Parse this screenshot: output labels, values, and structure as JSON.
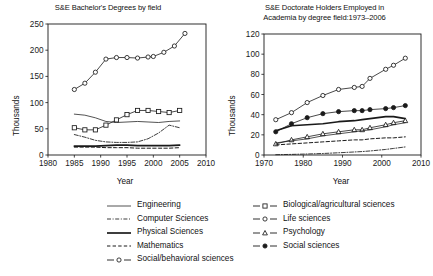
{
  "figure": {
    "ylabel": "Thousands",
    "xlabel": "Year"
  },
  "chart_data": [
    {
      "type": "line",
      "id": "bachelors",
      "title": "S&E Bachelor's Degrees by field",
      "title_line1": "S&E Bachelor's Degrees by field",
      "title_line2": "",
      "xlabel": "Year",
      "ylabel": "Thousands",
      "xlim": [
        1980,
        2010
      ],
      "ylim": [
        0,
        250
      ],
      "xticks": [
        1980,
        1985,
        1990,
        1995,
        2000,
        2005,
        2010
      ],
      "yticks": [
        0,
        50,
        100,
        150,
        200,
        250
      ],
      "grid": false,
      "legend_position": "below-figure",
      "series": [
        {
          "name": "Social/behavioral sciences",
          "marker": "open-circle",
          "linestyle": "solid",
          "x": [
            1985,
            1987,
            1989,
            1991,
            1993,
            1995,
            1997,
            1999,
            2000,
            2002,
            2004,
            2006
          ],
          "values": [
            125,
            137,
            158,
            183,
            186,
            186,
            185,
            187,
            188,
            196,
            208,
            232
          ]
        },
        {
          "name": "Biological/agricultural sciences",
          "marker": "open-square",
          "linestyle": "solid",
          "x": [
            1985,
            1987,
            1989,
            1991,
            1993,
            1995,
            1997,
            1999,
            2001,
            2003,
            2005
          ],
          "values": [
            52,
            48,
            48,
            57,
            67,
            77,
            85,
            85,
            83,
            81,
            85
          ]
        },
        {
          "name": "Engineering",
          "marker": "none",
          "linestyle": "solid-thin",
          "x": [
            1985,
            1987,
            1989,
            1991,
            1993,
            1995,
            1997,
            1999,
            2001,
            2003,
            2005
          ],
          "values": [
            78,
            76,
            71,
            64,
            62,
            63,
            64,
            63,
            62,
            64,
            65
          ]
        },
        {
          "name": "Computer Sciences",
          "marker": "none",
          "linestyle": "dash-dot",
          "x": [
            1985,
            1987,
            1989,
            1991,
            1993,
            1995,
            1997,
            1999,
            2001,
            2003,
            2005
          ],
          "values": [
            39,
            34,
            28,
            25,
            24,
            24,
            25,
            31,
            42,
            57,
            52
          ]
        },
        {
          "name": "Physical Sciences",
          "marker": "none",
          "linestyle": "solid-thick",
          "x": [
            1985,
            1987,
            1989,
            1991,
            1993,
            1995,
            1997,
            1999,
            2001,
            2003,
            2005
          ],
          "values": [
            17,
            17,
            17,
            18,
            19,
            19,
            18,
            18,
            18,
            18,
            19
          ]
        },
        {
          "name": "Mathematics",
          "marker": "none",
          "linestyle": "dashed",
          "x": [
            1985,
            1987,
            1989,
            1991,
            1993,
            1995,
            1997,
            1999,
            2001,
            2003,
            2005
          ],
          "values": [
            15,
            15,
            15,
            14,
            14,
            14,
            13,
            13,
            13,
            13,
            14
          ]
        }
      ]
    },
    {
      "type": "line",
      "id": "doctorate",
      "title": "S&E Doctorate Holders Employed in Academia by degree field:1973–2006",
      "title_line1": "S&E Doctorate Holders Employed in",
      "title_line2": "Academia by degree field:1973–2006",
      "xlabel": "Year",
      "ylabel": "Thousands",
      "xlim": [
        1970,
        2010
      ],
      "ylim": [
        0,
        120
      ],
      "xticks": [
        1970,
        1980,
        1990,
        2000,
        2010
      ],
      "yticks": [
        0,
        20,
        40,
        60,
        80,
        100,
        120
      ],
      "grid": false,
      "legend_position": "below-figure",
      "series": [
        {
          "name": "Life sciences",
          "marker": "open-circle",
          "linestyle": "solid",
          "x": [
            1973,
            1977,
            1981,
            1985,
            1989,
            1993,
            1995,
            1997,
            2001,
            2003,
            2006
          ],
          "values": [
            35,
            42,
            52,
            59,
            65,
            67,
            68,
            76,
            85,
            89,
            96
          ]
        },
        {
          "name": "Social sciences",
          "marker": "filled-circle",
          "linestyle": "solid",
          "x": [
            1973,
            1977,
            1981,
            1985,
            1989,
            1993,
            1995,
            1997,
            2001,
            2003,
            2006
          ],
          "values": [
            23,
            31,
            37,
            41,
            43,
            44,
            44,
            45,
            46,
            47,
            49
          ]
        },
        {
          "name": "Physical Sciences",
          "marker": "none",
          "linestyle": "solid-thick",
          "x": [
            1973,
            1977,
            1981,
            1985,
            1989,
            1993,
            1995,
            1997,
            2001,
            2003,
            2006
          ],
          "values": [
            24,
            29,
            30,
            31,
            33,
            34,
            35,
            36,
            38,
            38,
            36
          ]
        },
        {
          "name": "Psychology",
          "marker": "open-triangle",
          "linestyle": "solid",
          "x": [
            1973,
            1977,
            1981,
            1985,
            1989,
            1993,
            1995,
            1997,
            2001,
            2003,
            2006
          ],
          "values": [
            11,
            15,
            18,
            21,
            23,
            25,
            25,
            27,
            30,
            32,
            34
          ]
        },
        {
          "name": "Engineering",
          "marker": "none",
          "linestyle": "solid-thin",
          "x": [
            1973,
            1977,
            1981,
            1985,
            1989,
            1993,
            1995,
            1997,
            2001,
            2003,
            2006
          ],
          "values": [
            12,
            14,
            16,
            19,
            21,
            23,
            24,
            25,
            28,
            30,
            32
          ]
        },
        {
          "name": "Mathematics",
          "marker": "none",
          "linestyle": "dashed",
          "x": [
            1973,
            1977,
            1981,
            1985,
            1989,
            1993,
            1995,
            1997,
            2001,
            2003,
            2006
          ],
          "values": [
            10,
            11,
            12,
            13,
            14,
            15,
            15,
            16,
            17,
            17,
            18
          ]
        },
        {
          "name": "Computer Sciences",
          "marker": "none",
          "linestyle": "dash-dot",
          "x": [
            1973,
            1977,
            1981,
            1985,
            1989,
            1993,
            1995,
            1997,
            2001,
            2003,
            2006
          ],
          "values": [
            0.3,
            0.6,
            1.0,
            1.5,
            2.2,
            3.0,
            3.4,
            4.0,
            5.5,
            6.5,
            8.0
          ]
        }
      ]
    }
  ],
  "legend": {
    "left_column": [
      {
        "label": "Engineering",
        "key": "solid-thin"
      },
      {
        "label": "Computer Sciences",
        "key": "dash-dot"
      },
      {
        "label": "Physical Sciences",
        "key": "solid-thick"
      },
      {
        "label": "Mathematics",
        "key": "dashed"
      },
      {
        "label": "Social/behavioral sciences",
        "key": "open-circle"
      }
    ],
    "right_column": [
      {
        "label": "Biological/agricultural sciences",
        "key": "open-square"
      },
      {
        "label": "Life sciences",
        "key": "open-circle"
      },
      {
        "label": "Psychology",
        "key": "open-triangle"
      },
      {
        "label": "Social sciences",
        "key": "filled-circle"
      }
    ]
  },
  "colors": {
    "ink": "#1a1a1a",
    "background": "#ffffff"
  }
}
